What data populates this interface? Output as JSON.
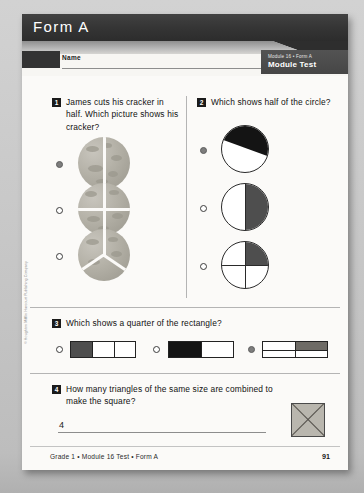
{
  "document": {
    "header_title": "Form A",
    "name_label": "Name",
    "badge_line1": "Module 16 • Form A",
    "badge_line2": "Module Test",
    "footer_text": "Grade 1 • Module 16 Test • Form A",
    "page_number": "91",
    "copyright": "© Houghton Mifflin Harcourt Publishing Company"
  },
  "questions": [
    {
      "number": "1",
      "text": "James cuts his cracker in half. Which picture shows his cracker?",
      "choices": [
        {
          "label": "cracker cut into halves",
          "selected": true
        },
        {
          "label": "cracker cut into quarters",
          "selected": false
        },
        {
          "label": "cracker cut into thirds",
          "selected": false
        }
      ]
    },
    {
      "number": "2",
      "text": "Which shows half of the circle?",
      "choices": [
        {
          "label": "circle with diagonal shaded region",
          "selected": true
        },
        {
          "label": "circle with right half shaded",
          "selected": false
        },
        {
          "label": "circle with one quarter shaded",
          "selected": false
        }
      ]
    },
    {
      "number": "3",
      "text": "Which shows a quarter of the rectangle?",
      "choices": [
        {
          "label": "rectangle in thirds, left third shaded",
          "selected": false
        },
        {
          "label": "rectangle in halves, left half shaded",
          "selected": false
        },
        {
          "label": "rectangle in quarters, top right quarter shaded",
          "selected": true
        }
      ]
    },
    {
      "number": "4",
      "text": "How many triangles of the same size are combined to make the square?",
      "answer": "4",
      "figure": "square divided by two diagonals into four triangles"
    }
  ],
  "colors": {
    "header_bar": "#343434",
    "badge": "#4a4a4a",
    "page": "#f7f6f3",
    "shade_dark": "#141414",
    "shade_gray": "#4e4e4e",
    "cracker": "#b4b1a7"
  }
}
